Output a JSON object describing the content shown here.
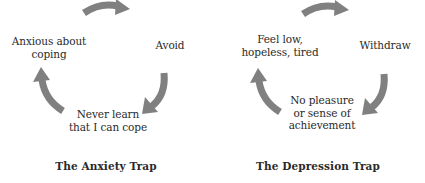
{
  "colors": {
    "arrow": "#808080",
    "text": "#2a2a2a",
    "background": "#ffffff"
  },
  "diagrams": [
    {
      "caption": "The Anxiety Trap",
      "nodes": [
        {
          "line1": "Anxious about",
          "line2": "coping",
          "line3": ""
        },
        {
          "line1": "Avoid",
          "line2": "",
          "line3": ""
        },
        {
          "line1": "Never learn",
          "line2": "that I can cope",
          "line3": ""
        }
      ]
    },
    {
      "caption": "The Depression Trap",
      "nodes": [
        {
          "line1": "Feel low,",
          "line2": "hopeless, tired",
          "line3": ""
        },
        {
          "line1": "Withdraw",
          "line2": "",
          "line3": ""
        },
        {
          "line1": "No pleasure",
          "line2": "or sense of",
          "line3": "achievement"
        }
      ]
    }
  ]
}
